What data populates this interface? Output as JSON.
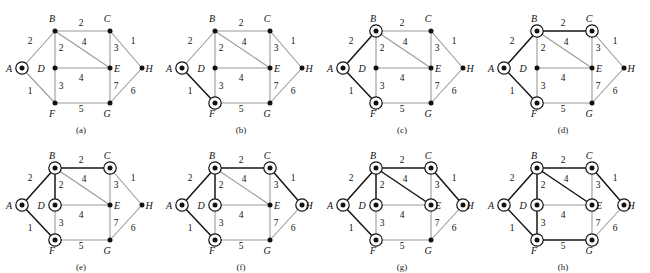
{
  "figure": {
    "type": "graph-algorithm-steps",
    "panel_count": 8,
    "colors": {
      "edge_inactive": "#9a9a9a",
      "edge_active": "#141414",
      "node_fill": "#111111",
      "ring_stroke": "#111111",
      "text": "#111111",
      "background": "#ffffff"
    },
    "nodes": [
      {
        "id": "A",
        "label": "A",
        "x": 22,
        "y": 68,
        "label_dx": -13,
        "label_dy": 4
      },
      {
        "id": "B",
        "label": "B",
        "x": 55,
        "y": 31,
        "label_dx": -3,
        "label_dy": -9
      },
      {
        "id": "C",
        "label": "C",
        "x": 110,
        "y": 31,
        "label_dx": -3,
        "label_dy": -9
      },
      {
        "id": "D",
        "label": "D",
        "x": 55,
        "y": 68,
        "label_dx": -14,
        "label_dy": 4
      },
      {
        "id": "E",
        "label": "E",
        "x": 110,
        "y": 68,
        "label_dx": 7,
        "label_dy": 4
      },
      {
        "id": "F",
        "label": "F",
        "x": 55,
        "y": 103,
        "label_dx": -3,
        "label_dy": 14
      },
      {
        "id": "G",
        "label": "G",
        "x": 110,
        "y": 103,
        "label_dx": -3,
        "label_dy": 14
      },
      {
        "id": "H",
        "label": "H",
        "x": 142,
        "y": 68,
        "label_dx": 7,
        "label_dy": 4
      }
    ],
    "edges": [
      {
        "id": "AB",
        "from": "A",
        "to": "B",
        "weight": "2",
        "wx": 30,
        "wy": 44
      },
      {
        "id": "AF",
        "from": "A",
        "to": "F",
        "weight": "1",
        "wx": 30,
        "wy": 94
      },
      {
        "id": "BC",
        "from": "B",
        "to": "C",
        "weight": "2",
        "wx": 81,
        "wy": 26
      },
      {
        "id": "BD",
        "from": "B",
        "to": "D",
        "weight": "2",
        "wx": 61,
        "wy": 51
      },
      {
        "id": "BE",
        "from": "B",
        "to": "E",
        "weight": "4",
        "wx": 84,
        "wy": 45
      },
      {
        "id": "CE",
        "from": "C",
        "to": "E",
        "weight": "3",
        "wx": 116,
        "wy": 51
      },
      {
        "id": "CH",
        "from": "C",
        "to": "H",
        "weight": "1",
        "wx": 133,
        "wy": 44
      },
      {
        "id": "DE",
        "from": "D",
        "to": "E",
        "weight": "4",
        "wx": 81,
        "wy": 81
      },
      {
        "id": "DF",
        "from": "D",
        "to": "F",
        "weight": "3",
        "wx": 61,
        "wy": 89
      },
      {
        "id": "EG",
        "from": "E",
        "to": "G",
        "weight": "7",
        "wx": 116,
        "wy": 89
      },
      {
        "id": "FG",
        "from": "F",
        "to": "G",
        "weight": "5",
        "wx": 81,
        "wy": 112
      },
      {
        "id": "GH",
        "from": "G",
        "to": "H",
        "weight": "6",
        "wx": 133,
        "wy": 94
      }
    ],
    "panels": [
      {
        "id": "a",
        "caption": "(a)",
        "left": 0,
        "top": 0,
        "ringed": [
          "A"
        ],
        "active_edges": []
      },
      {
        "id": "b",
        "caption": "(b)",
        "left": 160,
        "top": 0,
        "ringed": [
          "A",
          "F"
        ],
        "active_edges": [
          "AF"
        ]
      },
      {
        "id": "c",
        "caption": "(c)",
        "left": 321,
        "top": 0,
        "ringed": [
          "A",
          "B",
          "F"
        ],
        "active_edges": [
          "AF",
          "AB"
        ]
      },
      {
        "id": "d",
        "caption": "(d)",
        "left": 482,
        "top": 0,
        "ringed": [
          "A",
          "B",
          "C",
          "F"
        ],
        "active_edges": [
          "AF",
          "AB",
          "BC"
        ]
      },
      {
        "id": "e",
        "caption": "(e)",
        "left": 0,
        "top": 137,
        "ringed": [
          "A",
          "B",
          "C",
          "D",
          "F"
        ],
        "active_edges": [
          "AF",
          "AB",
          "BC",
          "BD"
        ]
      },
      {
        "id": "f",
        "caption": "(f)",
        "left": 160,
        "top": 137,
        "ringed": [
          "A",
          "B",
          "C",
          "D",
          "F",
          "H"
        ],
        "active_edges": [
          "AF",
          "AB",
          "BC",
          "BD",
          "CH"
        ]
      },
      {
        "id": "g",
        "caption": "(g)",
        "left": 321,
        "top": 137,
        "ringed": [
          "A",
          "B",
          "C",
          "D",
          "E",
          "F",
          "H"
        ],
        "active_edges": [
          "AF",
          "AB",
          "BC",
          "BD",
          "CH",
          "BE"
        ]
      },
      {
        "id": "h",
        "caption": "(h)",
        "left": 482,
        "top": 137,
        "ringed": [
          "A",
          "B",
          "C",
          "D",
          "E",
          "F",
          "G",
          "H"
        ],
        "active_edges": [
          "AF",
          "AB",
          "BC",
          "BD",
          "CH",
          "BE",
          "FG",
          "DF"
        ]
      }
    ]
  }
}
